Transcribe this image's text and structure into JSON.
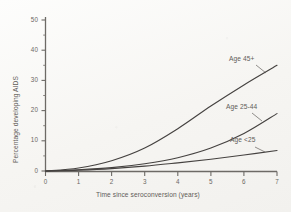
{
  "chart_data": {
    "type": "line",
    "title": "",
    "subtitle": "",
    "xlabel": "Time since seroconversion  (years)",
    "ylabel": "Percentage developing AIDS",
    "xlim": [
      0,
      7
    ],
    "ylim": [
      0,
      52
    ],
    "xticks": [
      "0",
      "1",
      "2",
      "3",
      "4",
      "5",
      "6",
      "7"
    ],
    "yticks": [
      "0",
      "10",
      "20",
      "30",
      "40",
      "50"
    ],
    "y_minor_ticks": [
      5,
      15,
      25,
      35,
      45
    ],
    "grid": false,
    "legend_position": "inline-right-of-curve",
    "annotations": [
      "Age 45+",
      "Age 25-44",
      "Age <25"
    ],
    "x": [
      0,
      1,
      2,
      3,
      4,
      5,
      6,
      7
    ],
    "series": [
      {
        "name": "Age 45+",
        "label": "Age 45+",
        "values": [
          0,
          1.0,
          3.4,
          7.6,
          14.0,
          21.5,
          28.5,
          35.0
        ],
        "color": "#454240"
      },
      {
        "name": "Age 25-44",
        "label": "Age 25-44",
        "values": [
          0,
          0.4,
          1.1,
          2.4,
          4.4,
          7.6,
          12.4,
          19.0
        ],
        "color": "#454240"
      },
      {
        "name": "Age <25",
        "label": "Age <25",
        "values": [
          0,
          0.3,
          0.8,
          1.6,
          2.7,
          3.9,
          5.3,
          6.8
        ],
        "color": "#454240"
      }
    ]
  },
  "axes": {
    "y_title": "Percentage developing AIDS",
    "x_title": "Time since seroconversion  (years)",
    "y_tick_labels": [
      "50",
      "40",
      "30",
      "20",
      "10",
      "0"
    ],
    "x_tick_labels": [
      "0",
      "1",
      "2",
      "3",
      "4",
      "5",
      "6",
      "7"
    ]
  },
  "series_labels": {
    "age_45_plus": "Age 45+",
    "age_25_44": "Age 25-44",
    "age_under_25": "Age <25"
  },
  "colors": {
    "curve": "#454240",
    "axis": "#6d6a66",
    "text": "#5f5c58",
    "background": "#f7f6f3"
  }
}
